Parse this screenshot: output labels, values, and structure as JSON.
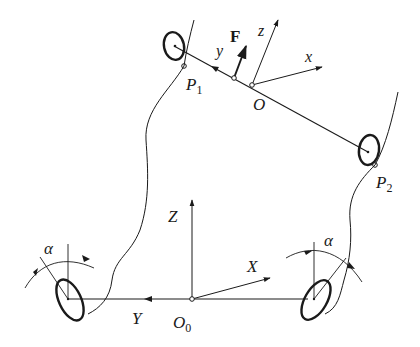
{
  "diagram": {
    "colors": {
      "stroke": "#1a1a1a",
      "background": "#ffffff"
    },
    "labels": {
      "force": "F",
      "local_y": "y",
      "local_z": "z",
      "local_x": "x",
      "local_origin": "O",
      "p1": "P",
      "p1_sub": "1",
      "p2": "P",
      "p2_sub": "2",
      "global_Z": "Z",
      "global_X": "X",
      "global_Y": "Y",
      "global_origin": "O",
      "global_origin_sub": "0",
      "alpha_left": "α",
      "alpha_right": "α"
    }
  }
}
